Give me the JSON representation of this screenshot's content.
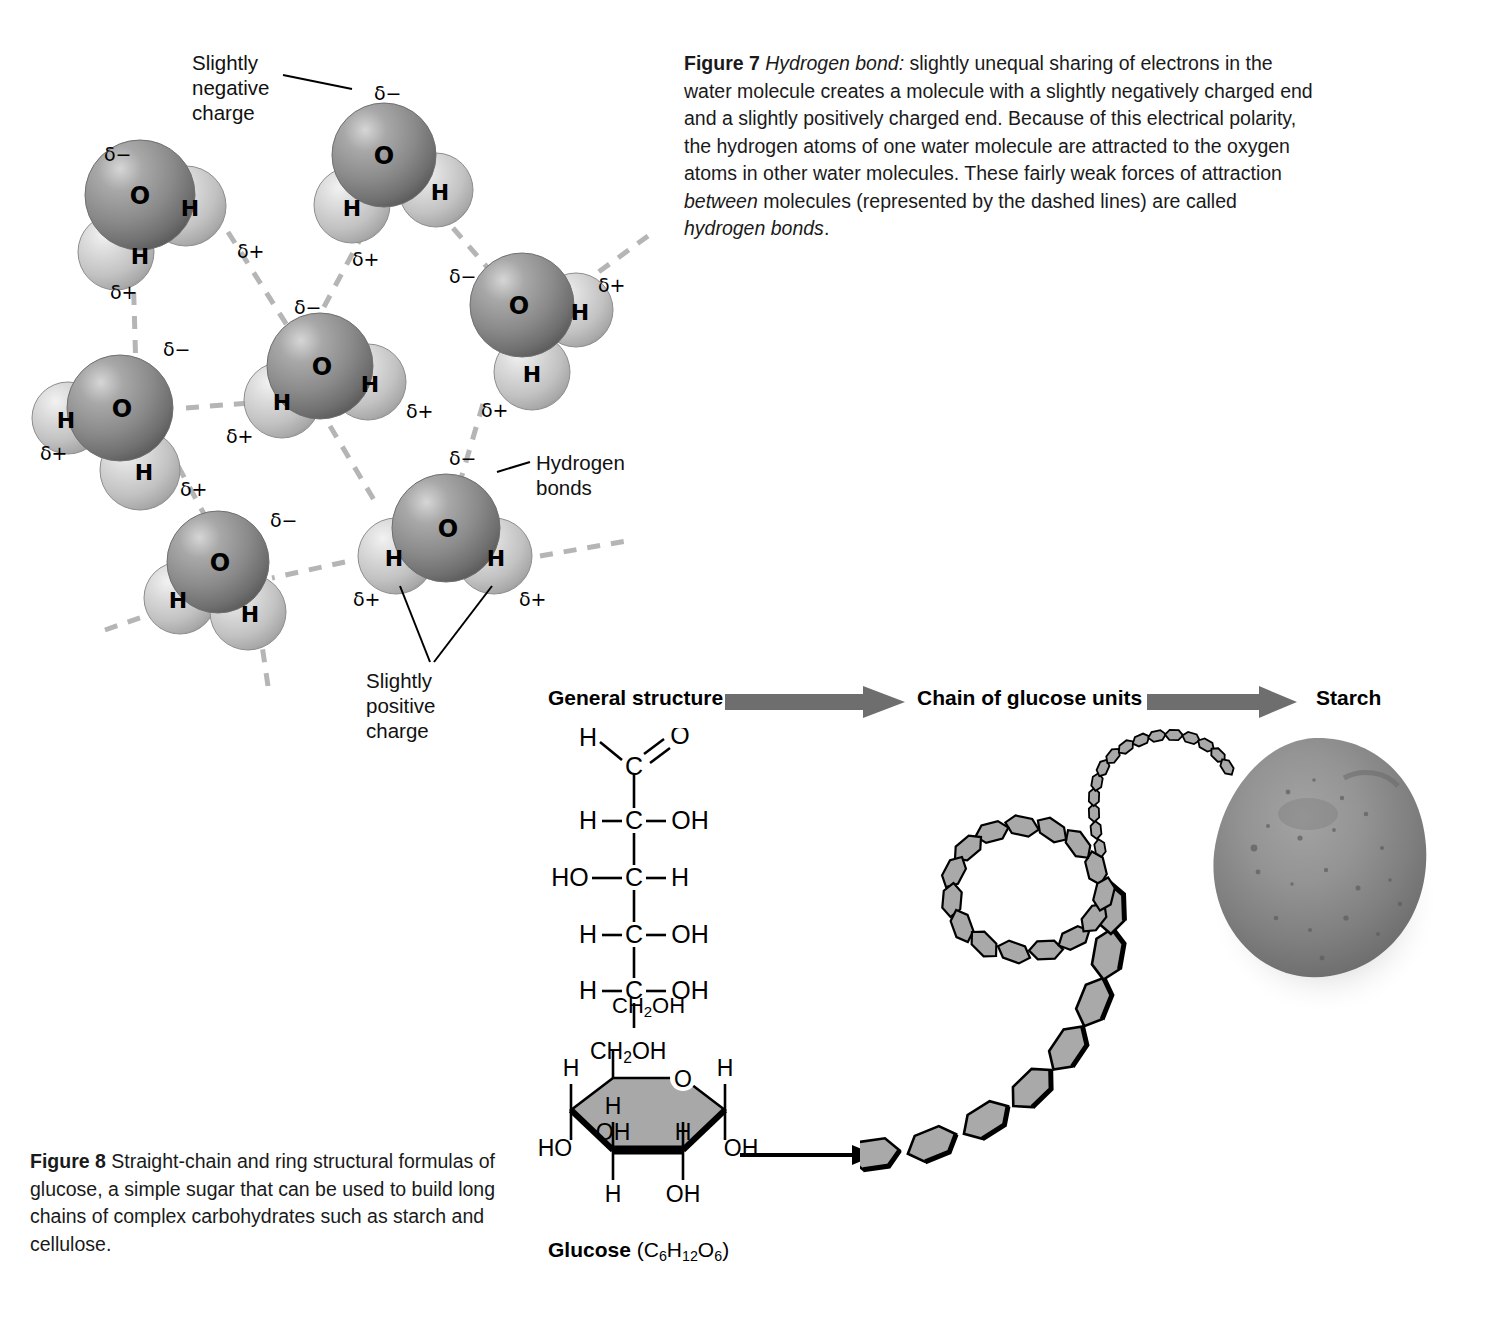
{
  "figure7": {
    "label": "Figure 7",
    "term": "Hydrogen bond:",
    "body_1": " slightly unequal sharing of electrons in the water molecule creates a molecule with a slightly negatively charged end and a slightly positively charged end. Because of this electrical polarity, the hydrogen atoms of one water molecule are attracted to the oxygen atoms in other water molecules. These fairly weak forces of attraction ",
    "ital_between": "between",
    "body_2": " molecules (represented by the dashed lines) are called ",
    "ital_bonds": "hydrogen bonds",
    "body_3": "."
  },
  "figure8": {
    "label": "Figure 8",
    "body": " Straight-chain and ring structural formulas of glucose, a simple sugar that can be used to build long chains of complex carbohydrates such as starch and cellulose."
  },
  "water_diagram": {
    "callouts": [
      {
        "name": "slightly-negative-charge",
        "text": "Slightly\nnegative\ncharge"
      },
      {
        "name": "hydrogen-bonds",
        "text": "Hydrogen\nbonds"
      },
      {
        "name": "slightly-positive-charge",
        "text": "Slightly\npositive\ncharge"
      }
    ],
    "atom_oxygen": "O",
    "atom_hydrogen": "H",
    "charge_negative": "δ−",
    "charge_positive": "δ+",
    "molecule_count": 6,
    "colors": {
      "oxygen": "#8e8e8e",
      "hydrogen": "#cfcfcf",
      "hydrogen_bond_dash": "#b5b5b5",
      "leader_line": "#000000"
    }
  },
  "carbohydrate_row": {
    "steps": [
      {
        "name": "general-structure",
        "label": "General structure"
      },
      {
        "name": "chain-of-glucose-units",
        "label": "Chain of glucose units"
      },
      {
        "name": "starch",
        "label": "Starch"
      }
    ],
    "arrow_color": "#6e6e6e"
  },
  "straight_chain": {
    "name": "fischer-projection-glucose",
    "rows": [
      {
        "left": "H",
        "center": "C",
        "right": "O",
        "bond_right": "double"
      },
      {
        "left": "H",
        "center": "C",
        "right": "OH",
        "bond_right": "single"
      },
      {
        "left": "HO",
        "center": "C",
        "right": "H",
        "bond_right": "single"
      },
      {
        "left": "H",
        "center": "C",
        "right": "OH",
        "bond_right": "single"
      },
      {
        "left": "H",
        "center": "C",
        "right": "OH",
        "bond_right": "single"
      },
      {
        "left": "",
        "center": "CH2OH",
        "right": "",
        "bond_right": "none"
      }
    ],
    "terminal_label": "CH",
    "terminal_sub": "2",
    "terminal_tail": "OH"
  },
  "ring_structure": {
    "name": "haworth-projection-glucose",
    "top_label": "CH2OH",
    "ring_oxygen": "O",
    "substituents": {
      "upper_left_h": "H",
      "upper_right_h": "H",
      "inner_h_left": "H",
      "inner_oh_left": "OH",
      "inner_h_right": "H",
      "lower_left_ho": "HO",
      "lower_right_oh": "OH",
      "bottom_h": "H",
      "bottom_oh": "OH"
    },
    "caption_name": "Glucose",
    "caption_formula_open": " (C",
    "caption_formula": "C6H12O6",
    "fill_color": "#a8a8a8"
  },
  "starch_chain": {
    "name": "glucose-unit-chain",
    "unit_fill": "#a9a9a9",
    "unit_outline": "#000000",
    "description_units": 34
  },
  "potato": {
    "name": "potato-photo",
    "body_color": "#8a8a8a",
    "shadow_color": "#bdbdbd"
  }
}
